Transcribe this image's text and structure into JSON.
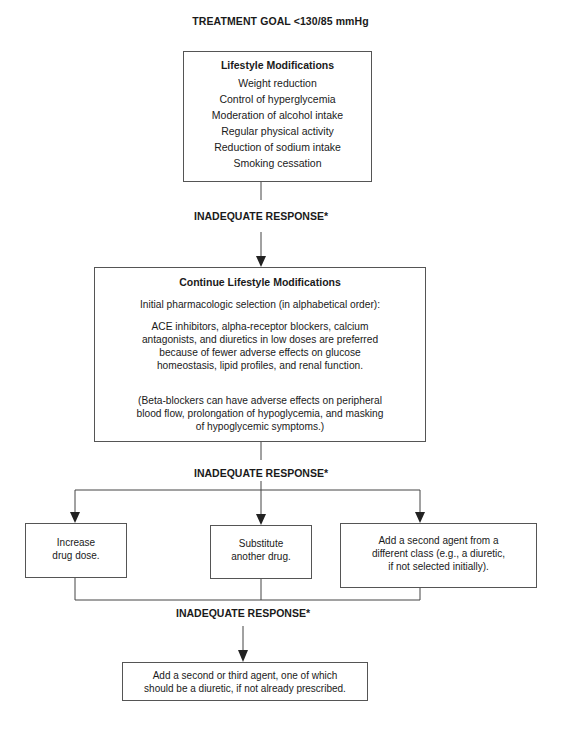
{
  "title": "TREATMENT GOAL <130/85 mmHg",
  "lifestyle_box": {
    "title": "Lifestyle  Modifications",
    "items": [
      "Weight reduction",
      "Control of hyperglycemia",
      "Moderation of alcohol intake",
      "Regular physical activity",
      "Reduction of sodium intake",
      "Smoking cessation"
    ]
  },
  "response_labels": [
    "INADEQUATE RESPONSE*",
    "INADEQUATE RESPONSE*",
    "INADEQUATE RESPONSE*"
  ],
  "continue_box": {
    "title": "Continue Lifestyle Modifications",
    "subtitle": "Initial pharmacologic selection (in alphabetical order):",
    "paragraph1_lines": [
      "ACE inhibitors, alpha-receptor blockers, calcium",
      "antagonists, and diuretics in low doses are preferred",
      "because of fewer adverse effects on glucose",
      "homeostasis, lipid profiles, and renal function."
    ],
    "paragraph2_lines": [
      "(Beta-blockers can have adverse effects on peripheral",
      "blood flow, prolongation of hypoglycemia, and masking",
      "of hypoglycemic symptoms.)"
    ]
  },
  "options": [
    {
      "lines": [
        "Increase",
        "drug dose."
      ]
    },
    {
      "lines": [
        "Substitute",
        "another drug."
      ]
    },
    {
      "lines": [
        "Add a second agent from a",
        "different class (e.g., a diuretic,",
        "if not selected initially)."
      ]
    }
  ],
  "final_box": {
    "lines": [
      "Add a second or third agent, one of which",
      "should be a diuretic, if not already prescribed."
    ]
  },
  "colors": {
    "line": "#444444",
    "border": "#555555",
    "text": "#1a1a1a"
  }
}
